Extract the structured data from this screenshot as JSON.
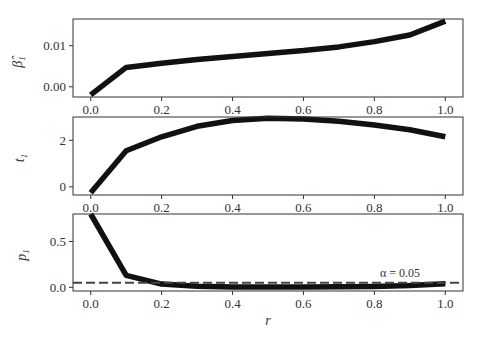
{
  "chart_data": [
    {
      "type": "line",
      "panel": 1,
      "ylabel": "β̂₁",
      "x": [
        0.0,
        0.1,
        0.2,
        0.3,
        0.4,
        0.5,
        0.6,
        0.7,
        0.8,
        0.9,
        1.0
      ],
      "series": [
        {
          "name": "beta_hat_1",
          "values": [
            -0.002,
            0.0047,
            0.0057,
            0.0066,
            0.0074,
            0.0081,
            0.0088,
            0.0097,
            0.011,
            0.0126,
            0.016
          ]
        }
      ],
      "ylim": [
        -0.0025,
        0.0165
      ],
      "yticks": [
        0.0,
        0.01
      ],
      "ytick_labels": [
        "0.00",
        "0.01"
      ],
      "xlim": [
        -0.05,
        1.05
      ],
      "xticks": [
        0.0,
        0.2,
        0.4,
        0.6,
        0.8,
        1.0
      ],
      "xtick_labels": [
        "0.0",
        "0.2",
        "0.4",
        "0.6",
        "0.8",
        "1.0"
      ],
      "grid": false
    },
    {
      "type": "line",
      "panel": 2,
      "ylabel": "t₁",
      "x": [
        0.0,
        0.1,
        0.2,
        0.3,
        0.4,
        0.5,
        0.6,
        0.7,
        0.8,
        0.9,
        1.0
      ],
      "series": [
        {
          "name": "t_1",
          "values": [
            -0.25,
            1.55,
            2.15,
            2.6,
            2.85,
            2.95,
            2.92,
            2.82,
            2.65,
            2.45,
            2.15
          ]
        }
      ],
      "ylim": [
        -0.35,
        3.0
      ],
      "yticks": [
        0,
        2
      ],
      "ytick_labels": [
        "0",
        "2"
      ],
      "xlim": [
        -0.05,
        1.05
      ],
      "xticks": [
        0.0,
        0.2,
        0.4,
        0.6,
        0.8,
        1.0
      ],
      "xtick_labels": [
        "0.0",
        "0.2",
        "0.4",
        "0.6",
        "0.8",
        "1.0"
      ],
      "grid": false
    },
    {
      "type": "line",
      "panel": 3,
      "ylabel": "p₁",
      "xlabel": "r",
      "x": [
        0.0,
        0.1,
        0.2,
        0.3,
        0.4,
        0.5,
        0.6,
        0.7,
        0.8,
        0.9,
        1.0
      ],
      "series": [
        {
          "name": "p_1",
          "values": [
            0.8,
            0.13,
            0.035,
            0.012,
            0.005,
            0.003,
            0.004,
            0.006,
            0.01,
            0.02,
            0.04
          ]
        },
        {
          "name": "alpha",
          "style": "dashed",
          "values": [
            0.05,
            0.05,
            0.05,
            0.05,
            0.05,
            0.05,
            0.05,
            0.05,
            0.05,
            0.05,
            0.05
          ]
        }
      ],
      "annotations": [
        {
          "text": "α = 0.05",
          "x": 0.87,
          "y": 0.1
        }
      ],
      "ylim": [
        -0.04,
        0.8
      ],
      "yticks": [
        0.0,
        0.5
      ],
      "ytick_labels": [
        "0.0",
        "0.5"
      ],
      "xlim": [
        -0.05,
        1.05
      ],
      "xticks": [
        0.0,
        0.2,
        0.4,
        0.6,
        0.8,
        1.0
      ],
      "xtick_labels": [
        "0.0",
        "0.2",
        "0.4",
        "0.6",
        "0.8",
        "1.0"
      ],
      "grid": false
    }
  ],
  "labels": {
    "panel1_ylabel": "β̂",
    "panel1_ylabel_sub": "1",
    "panel2_ylabel": "t",
    "panel2_ylabel_sub": "1",
    "panel3_ylabel": "p",
    "panel3_ylabel_sub": "1",
    "xlabel": "r",
    "alpha_annotation": "α = 0.05"
  },
  "colors": {
    "line": "#111111",
    "dashed": "#444444",
    "axes": "#333333"
  }
}
